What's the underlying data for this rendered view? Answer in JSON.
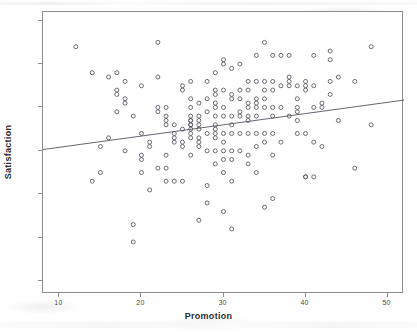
{
  "chart_data": {
    "type": "scatter",
    "title": "",
    "subtitle": "",
    "xlabel": "Promotion",
    "ylabel": "Satisfaction",
    "xlim": [
      8,
      52
    ],
    "ylim": [
      27,
      92
    ],
    "xticks": [
      10,
      20,
      30,
      40,
      50
    ],
    "yticks": [
      30,
      40,
      50,
      60,
      70,
      80,
      90
    ],
    "grid": false,
    "legend": null,
    "marker": {
      "style": "open-circle",
      "size_px": 4,
      "color": "#5b5b66"
    },
    "annotations": [],
    "fit_line": {
      "type": "linear-regression",
      "color": "#55555f",
      "x_start": 8,
      "y_start": 60.3,
      "x_end": 52,
      "y_end": 71.7
    },
    "x": [
      12,
      14,
      14,
      15,
      15,
      16,
      16,
      17,
      17,
      17,
      17,
      18,
      18,
      18,
      18,
      19,
      19,
      19,
      20,
      20,
      20,
      20,
      20,
      21,
      21,
      21,
      22,
      22,
      22,
      22,
      22,
      23,
      23,
      23,
      23,
      23,
      23,
      23,
      24,
      24,
      24,
      24,
      24,
      25,
      25,
      25,
      25,
      25,
      25,
      26,
      26,
      26,
      26,
      26,
      26,
      26,
      26,
      26,
      26,
      26,
      26,
      27,
      27,
      27,
      27,
      27,
      27,
      27,
      27,
      27,
      28,
      28,
      28,
      28,
      28,
      28,
      28,
      29,
      29,
      29,
      29,
      29,
      29,
      29,
      29,
      29,
      29,
      29,
      29,
      30,
      30,
      30,
      30,
      30,
      30,
      30,
      30,
      30,
      30,
      30,
      31,
      31,
      31,
      31,
      31,
      31,
      31,
      31,
      31,
      31,
      32,
      32,
      32,
      32,
      32,
      32,
      32,
      33,
      33,
      33,
      33,
      33,
      33,
      33,
      33,
      33,
      34,
      34,
      34,
      34,
      34,
      34,
      34,
      34,
      34,
      35,
      35,
      35,
      35,
      35,
      35,
      35,
      35,
      36,
      36,
      36,
      36,
      36,
      36,
      36,
      36,
      37,
      37,
      37,
      37,
      38,
      38,
      38,
      38,
      38,
      39,
      39,
      39,
      39,
      39,
      39,
      40,
      40,
      40,
      40,
      40,
      40,
      41,
      41,
      41,
      41,
      41,
      42,
      42,
      42,
      43,
      43,
      43,
      43,
      44,
      44,
      46,
      46,
      48,
      48
    ],
    "y": [
      84,
      78,
      53,
      61,
      55,
      77,
      63,
      78,
      73,
      74,
      69,
      76,
      72,
      71,
      60,
      68,
      43,
      39,
      75,
      64,
      58,
      59,
      55,
      61,
      62,
      51,
      85,
      77,
      70,
      69,
      56,
      70,
      68,
      66,
      67,
      59,
      56,
      53,
      66,
      64,
      63,
      62,
      53,
      75,
      74,
      65,
      62,
      61,
      53,
      76,
      72,
      70,
      68,
      67,
      67,
      66,
      66,
      65,
      64,
      63,
      59,
      71,
      68,
      67,
      66,
      65,
      63,
      62,
      61,
      44,
      76,
      72,
      69,
      64,
      60,
      52,
      48,
      78,
      74,
      73,
      71,
      70,
      68,
      66,
      65,
      64,
      63,
      60,
      57,
      81,
      80,
      74,
      70,
      68,
      64,
      62,
      60,
      58,
      55,
      46,
      79,
      73,
      72,
      68,
      66,
      64,
      60,
      58,
      53,
      42,
      80,
      74,
      72,
      69,
      68,
      64,
      60,
      76,
      74,
      71,
      70,
      68,
      67,
      64,
      59,
      57,
      82,
      76,
      72,
      71,
      70,
      68,
      64,
      61,
      55,
      85,
      76,
      74,
      72,
      70,
      64,
      62,
      47,
      82,
      76,
      74,
      70,
      68,
      64,
      59,
      49,
      82,
      75,
      70,
      62,
      82,
      77,
      76,
      75,
      68,
      75,
      72,
      70,
      69,
      67,
      64,
      76,
      75,
      74,
      64,
      54,
      54,
      82,
      75,
      70,
      62,
      54,
      70,
      71,
      61,
      83,
      81,
      76,
      73,
      77,
      67,
      76,
      56,
      84,
      66
    ]
  },
  "axis": {
    "y_title": "Satisfaction",
    "x_title": "Promotion",
    "y_tick_labels": [
      "90",
      "80",
      "70",
      "60",
      "50",
      "40",
      "30"
    ],
    "x_tick_labels": [
      "10",
      "20",
      "30",
      "40",
      "50"
    ]
  }
}
